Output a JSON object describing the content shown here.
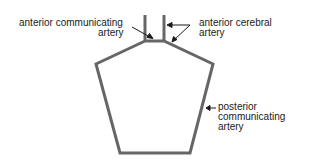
{
  "diagram": {
    "line_color": "#666666",
    "labels": {
      "acomm_line1": "anterior communicating",
      "acomm_line2": "artery",
      "aca_line1": "anterior cerebral",
      "aca_line2": "artery",
      "pcomm_line1": "posterior",
      "pcomm_line2": "communicating",
      "pcomm_line3": "artery"
    }
  }
}
